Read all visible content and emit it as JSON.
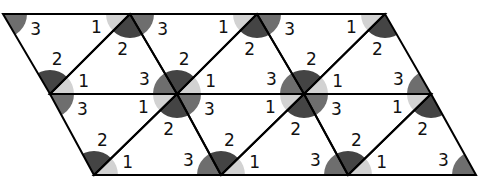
{
  "diagram": {
    "colors": {
      "angle_1": "#d2d2d2",
      "angle_2": "#444444",
      "angle_3": "#6e6e6e",
      "edge": "#000000",
      "background": "#ffffff"
    },
    "sector_radius": 24,
    "rows": {
      "top": {
        "y": 14,
        "x": [
          3,
          130,
          257,
          385
        ]
      },
      "middle": {
        "y": 94,
        "x": [
          50,
          177,
          304,
          431
        ]
      },
      "bottom": {
        "y": 175,
        "x": [
          94,
          221,
          348,
          476
        ]
      }
    },
    "labels": {
      "one": "1",
      "two": "2",
      "three": "3"
    },
    "triangles": [
      {
        "kind": "down",
        "strip": "top",
        "i": 0
      },
      {
        "kind": "up",
        "strip": "top",
        "i": 0
      },
      {
        "kind": "down",
        "strip": "top",
        "i": 1
      },
      {
        "kind": "up",
        "strip": "top",
        "i": 1
      },
      {
        "kind": "down",
        "strip": "top",
        "i": 2
      },
      {
        "kind": "up",
        "strip": "top",
        "i": 2
      },
      {
        "kind": "down",
        "strip": "bottom",
        "i": 0
      },
      {
        "kind": "up",
        "strip": "bottom",
        "i": 0
      },
      {
        "kind": "down",
        "strip": "bottom",
        "i": 1
      },
      {
        "kind": "up",
        "strip": "bottom",
        "i": 1
      },
      {
        "kind": "down",
        "strip": "bottom",
        "i": 2
      },
      {
        "kind": "up",
        "strip": "bottom",
        "i": 2
      }
    ]
  }
}
